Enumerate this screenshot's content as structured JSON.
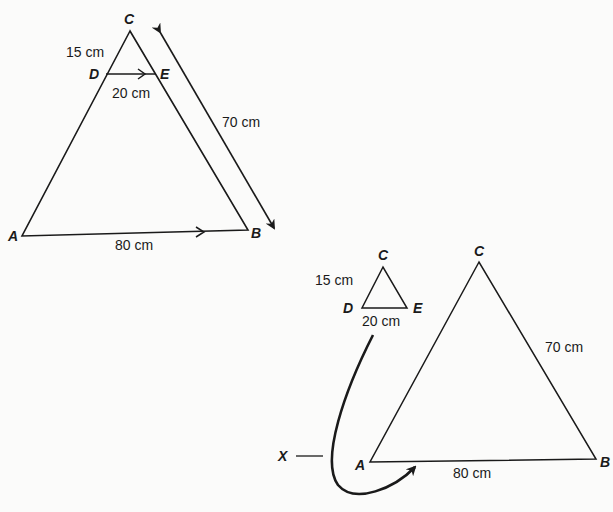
{
  "figure_top": {
    "vertices": {
      "C": "C",
      "D": "D",
      "E": "E",
      "A": "A",
      "B": "B"
    },
    "lengths": {
      "CD": "15 cm",
      "DE": "20 cm",
      "CB": "70 cm",
      "AB": "80 cm"
    }
  },
  "figure_bottom": {
    "small_triangle": {
      "vertices": {
        "C": "C",
        "D": "D",
        "E": "E"
      },
      "lengths": {
        "CD": "15 cm",
        "DE": "20 cm"
      }
    },
    "large_triangle": {
      "vertices": {
        "C": "C",
        "A": "A",
        "B": "B"
      },
      "lengths": {
        "CB": "70 cm",
        "AB": "80 cm"
      }
    },
    "pointer_label": "X"
  },
  "colors": {
    "stroke": "#1a1a1a",
    "background": "#fbfbfa"
  }
}
